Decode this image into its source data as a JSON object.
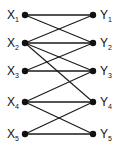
{
  "diagram": {
    "type": "bipartite-graph",
    "colors": {
      "line": "#1a1a1a",
      "node": "#111111",
      "background": "#ffffff"
    },
    "left_nodes": [
      {
        "id": "X1",
        "letter": "X",
        "sub": "1",
        "x": 25,
        "y": 15
      },
      {
        "id": "X2",
        "letter": "X",
        "sub": "2",
        "x": 25,
        "y": 43
      },
      {
        "id": "X3",
        "letter": "X",
        "sub": "3",
        "x": 25,
        "y": 71
      },
      {
        "id": "X4",
        "letter": "X",
        "sub": "4",
        "x": 25,
        "y": 102
      },
      {
        "id": "X5",
        "letter": "X",
        "sub": "5",
        "x": 25,
        "y": 134
      }
    ],
    "right_nodes": [
      {
        "id": "Y1",
        "letter": "Y",
        "sub": "1",
        "x": 93,
        "y": 15
      },
      {
        "id": "Y2",
        "letter": "Y",
        "sub": "2",
        "x": 93,
        "y": 43
      },
      {
        "id": "Y3",
        "letter": "Y",
        "sub": "3",
        "x": 93,
        "y": 71
      },
      {
        "id": "Y4",
        "letter": "Y",
        "sub": "4",
        "x": 93,
        "y": 102
      },
      {
        "id": "Y5",
        "letter": "Y",
        "sub": "5",
        "x": 93,
        "y": 134
      }
    ],
    "edges": [
      [
        "X1",
        "Y1"
      ],
      [
        "X1",
        "Y2"
      ],
      [
        "X2",
        "Y1"
      ],
      [
        "X2",
        "Y2"
      ],
      [
        "X2",
        "Y3"
      ],
      [
        "X2",
        "Y4"
      ],
      [
        "X3",
        "Y2"
      ],
      [
        "X3",
        "Y3"
      ],
      [
        "X4",
        "Y3"
      ],
      [
        "X4",
        "Y4"
      ],
      [
        "X4",
        "Y5"
      ],
      [
        "X5",
        "Y4"
      ],
      [
        "X5",
        "Y5"
      ]
    ]
  }
}
